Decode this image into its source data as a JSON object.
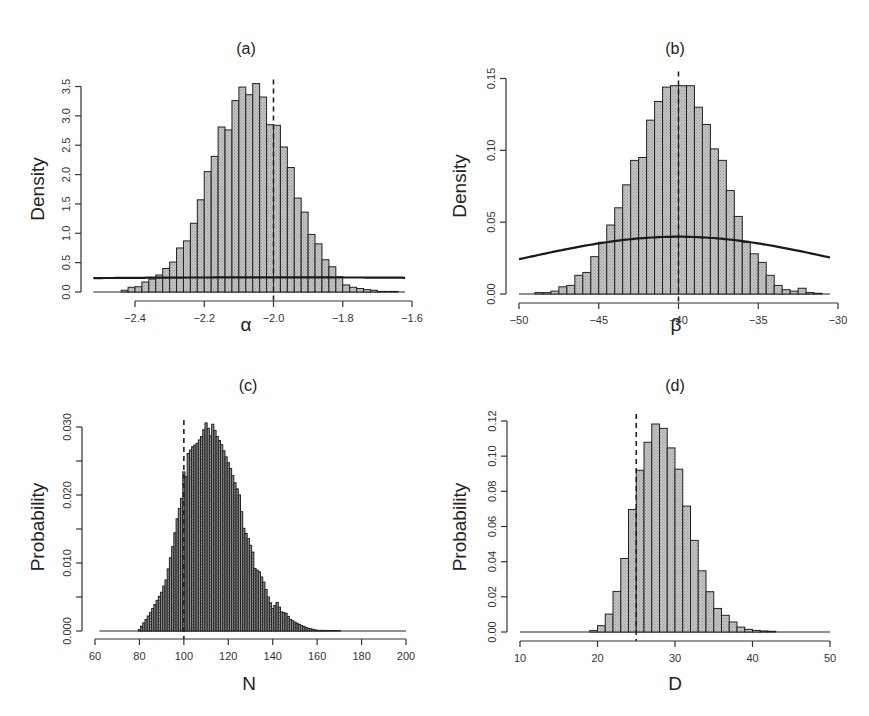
{
  "figure": {
    "panels": [
      "a",
      "b",
      "c",
      "d"
    ]
  },
  "chart_data": [
    {
      "id": "a",
      "type": "bar",
      "title": "(a)",
      "xlabel": "α",
      "ylabel": "Density",
      "xticks": [
        -2.4,
        -2.2,
        -2.0,
        -1.8,
        -1.6
      ],
      "xtick_labels": [
        "−2.4",
        "−2.2",
        "−2.0",
        "−1.8",
        "−1.6"
      ],
      "yticks": [
        0.0,
        0.5,
        1.0,
        1.5,
        2.0,
        2.5,
        3.0,
        3.5
      ],
      "ytick_labels": [
        "0.0",
        "0.5",
        "1.0",
        "1.5",
        "2.0",
        "2.5",
        "3.0",
        "3.5"
      ],
      "xlim": [
        -2.52,
        -1.62
      ],
      "ylim": [
        0,
        3.5
      ],
      "bin_start": -2.44,
      "bin_width": 0.02,
      "values": [
        0.03,
        0.08,
        0.09,
        0.17,
        0.22,
        0.29,
        0.4,
        0.51,
        0.75,
        0.87,
        1.17,
        1.57,
        2.05,
        2.31,
        2.81,
        2.76,
        3.26,
        3.49,
        3.36,
        3.55,
        3.32,
        2.85,
        2.84,
        2.47,
        2.12,
        1.6,
        1.36,
        0.98,
        0.82,
        0.55,
        0.43,
        0.26,
        0.12,
        0.08,
        0.06,
        0.04,
        0.03,
        0.01,
        0.01,
        0.01
      ],
      "prior": {
        "kind": "normal",
        "mean": -2.0,
        "sd": 1.6,
        "from": -2.52,
        "to": -1.62
      },
      "true_value": -2.0,
      "grid": false
    },
    {
      "id": "b",
      "type": "bar",
      "title": "(b)",
      "xlabel": "β",
      "ylabel": "Density",
      "xticks": [
        -50,
        -45,
        -40,
        -35,
        -30
      ],
      "xtick_labels": [
        "−50",
        "−45",
        "−40",
        "−35",
        "−30"
      ],
      "yticks": [
        0.0,
        0.05,
        0.1,
        0.15
      ],
      "ytick_labels": [
        "0.00",
        "0.05",
        "0.10",
        "0.15"
      ],
      "xlim": [
        -50,
        -30.5
      ],
      "ylim": [
        0,
        0.15
      ],
      "bin_start": -49.0,
      "bin_width": 0.5,
      "values": [
        0.001,
        0.001,
        0.002,
        0.005,
        0.006,
        0.013,
        0.015,
        0.026,
        0.036,
        0.048,
        0.06,
        0.076,
        0.093,
        0.095,
        0.121,
        0.134,
        0.144,
        0.145,
        0.145,
        0.145,
        0.13,
        0.118,
        0.101,
        0.093,
        0.072,
        0.054,
        0.036,
        0.028,
        0.022,
        0.013,
        0.006,
        0.003,
        0.002,
        0.004,
        0.001,
        0.0005
      ],
      "prior": {
        "kind": "normal",
        "mean": -40,
        "sd": 10,
        "from": -50,
        "to": -30.5
      },
      "true_value": -40,
      "grid": false
    },
    {
      "id": "c",
      "type": "bar",
      "title": "(c)",
      "xlabel": "N",
      "ylabel": "Probability",
      "xticks": [
        60,
        80,
        100,
        120,
        140,
        160,
        180,
        200
      ],
      "xtick_labels": [
        "60",
        "80",
        "100",
        "120",
        "140",
        "160",
        "180",
        "200"
      ],
      "yticks": [
        0.0,
        0.005,
        0.01,
        0.015,
        0.02,
        0.025,
        0.03
      ],
      "ytick_labels": [
        "0.000",
        "",
        "0.010",
        "",
        "0.020",
        "",
        "0.030"
      ],
      "xlim": [
        60,
        200
      ],
      "ylim": [
        0,
        0.03
      ],
      "bin_start": 79.5,
      "bin_width": 1,
      "keypoints": [
        [
          79.5,
          0.0001
        ],
        [
          80,
          0.0002
        ],
        [
          82,
          0.0012
        ],
        [
          85,
          0.0027
        ],
        [
          88,
          0.0045
        ],
        [
          90,
          0.0057
        ],
        [
          92,
          0.0075
        ],
        [
          95,
          0.0124
        ],
        [
          97,
          0.0165
        ],
        [
          99,
          0.0195
        ],
        [
          100,
          0.0234
        ],
        [
          101,
          0.0227
        ],
        [
          102,
          0.0261
        ],
        [
          104,
          0.0271
        ],
        [
          106,
          0.0276
        ],
        [
          108,
          0.0286
        ],
        [
          110,
          0.0306
        ],
        [
          111,
          0.0298
        ],
        [
          112,
          0.0287
        ],
        [
          113,
          0.0304
        ],
        [
          115,
          0.0286
        ],
        [
          117,
          0.0274
        ],
        [
          119,
          0.0256
        ],
        [
          121,
          0.0239
        ],
        [
          123,
          0.0218
        ],
        [
          125,
          0.02
        ],
        [
          127,
          0.0151
        ],
        [
          129,
          0.0136
        ],
        [
          131,
          0.0116
        ],
        [
          132,
          0.0092
        ],
        [
          134,
          0.0087
        ],
        [
          136,
          0.0072
        ],
        [
          138,
          0.005
        ],
        [
          140,
          0.0033
        ],
        [
          142,
          0.0042
        ],
        [
          144,
          0.0028
        ],
        [
          146,
          0.0026
        ],
        [
          148,
          0.0017
        ],
        [
          150,
          0.0013
        ],
        [
          153,
          0.0008
        ],
        [
          156,
          0.0004
        ],
        [
          160,
          0.0001
        ],
        [
          170,
          5e-05
        ]
      ],
      "baseline_from": 62,
      "baseline_to": 200,
      "true_value": 100,
      "grid": false
    },
    {
      "id": "d",
      "type": "bar",
      "title": "(d)",
      "xlabel": "D",
      "ylabel": "Probability",
      "xticks": [
        10,
        20,
        30,
        40,
        50
      ],
      "xtick_labels": [
        "10",
        "20",
        "30",
        "40",
        "50"
      ],
      "yticks": [
        0.0,
        0.02,
        0.04,
        0.06,
        0.08,
        0.1,
        0.12
      ],
      "ytick_labels": [
        "0.00",
        "0.02",
        "0.04",
        "0.06",
        "0.08",
        "0.10",
        "0.12"
      ],
      "xlim": [
        10,
        50
      ],
      "ylim": [
        0,
        0.12
      ],
      "bin_start": 19,
      "bin_width": 1,
      "values": [
        0.0008,
        0.0036,
        0.0102,
        0.0231,
        0.0418,
        0.0697,
        0.092,
        0.1079,
        0.1183,
        0.1158,
        0.1047,
        0.0926,
        0.0716,
        0.0521,
        0.0348,
        0.0229,
        0.0134,
        0.0095,
        0.0057,
        0.0028,
        0.0015,
        0.0009,
        0.0006,
        0.0004
      ],
      "baseline_from": 10,
      "baseline_to": 50,
      "true_value": 25,
      "grid": false
    }
  ],
  "style": {
    "bar_fill": "#bdbdbd",
    "bar_fill_dense": "#8a8a8a",
    "line_color": "#1a1a1a"
  }
}
